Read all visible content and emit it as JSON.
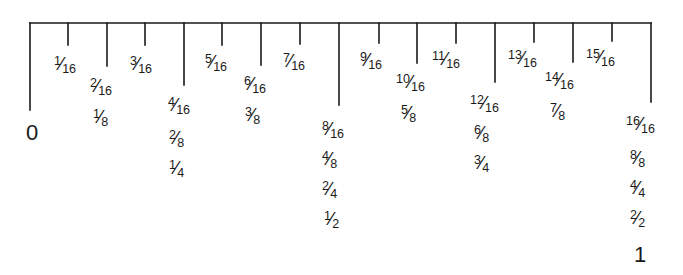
{
  "diagram": {
    "start_label": "0",
    "end_label": "1",
    "top_line": {
      "x1": 30,
      "x2": 651,
      "y": 23
    },
    "ticks": [
      {
        "index": 0,
        "x": 30,
        "y2": 110
      },
      {
        "index": 1,
        "x": 68,
        "y2": 45
      },
      {
        "index": 2,
        "x": 107,
        "y2": 66
      },
      {
        "index": 3,
        "x": 145,
        "y2": 45
      },
      {
        "index": 4,
        "x": 184,
        "y2": 85
      },
      {
        "index": 5,
        "x": 222,
        "y2": 45
      },
      {
        "index": 6,
        "x": 261,
        "y2": 65
      },
      {
        "index": 7,
        "x": 300,
        "y2": 44
      },
      {
        "index": 8,
        "x": 339,
        "y2": 105
      },
      {
        "index": 9,
        "x": 379,
        "y2": 43
      },
      {
        "index": 10,
        "x": 417,
        "y2": 63
      },
      {
        "index": 11,
        "x": 456,
        "y2": 43
      },
      {
        "index": 12,
        "x": 495,
        "y2": 82
      },
      {
        "index": 13,
        "x": 534,
        "y2": 42
      },
      {
        "index": 14,
        "x": 573,
        "y2": 62
      },
      {
        "index": 15,
        "x": 612,
        "y2": 41
      },
      {
        "index": 16,
        "x": 651,
        "y2": 102
      }
    ],
    "labels": [
      {
        "text": "1/16",
        "num": "1",
        "den": "16",
        "x": 54,
        "y": 71
      },
      {
        "text": "3/16",
        "num": "3",
        "den": "16",
        "x": 130,
        "y": 71
      },
      {
        "text": "2/16",
        "num": "2",
        "den": "16",
        "x": 90,
        "y": 93
      },
      {
        "text": "1/8",
        "num": "1",
        "den": "8",
        "x": 93,
        "y": 124
      },
      {
        "text": "5/16",
        "num": "5",
        "den": "16",
        "x": 205,
        "y": 69
      },
      {
        "text": "7/16",
        "num": "7",
        "den": "16",
        "x": 283,
        "y": 68
      },
      {
        "text": "6/16",
        "num": "6",
        "den": "16",
        "x": 244,
        "y": 91
      },
      {
        "text": "3/8",
        "num": "3",
        "den": "8",
        "x": 245,
        "y": 122
      },
      {
        "text": "4/16",
        "num": "4",
        "den": "16",
        "x": 168,
        "y": 112
      },
      {
        "text": "2/8",
        "num": "2",
        "den": "8",
        "x": 169,
        "y": 145
      },
      {
        "text": "1/4",
        "num": "1",
        "den": "4",
        "x": 169,
        "y": 175
      },
      {
        "text": "8/16",
        "num": "8",
        "den": "16",
        "x": 322,
        "y": 136
      },
      {
        "text": "4/8",
        "num": "4",
        "den": "8",
        "x": 322,
        "y": 166
      },
      {
        "text": "2/4",
        "num": "2",
        "den": "4",
        "x": 322,
        "y": 196
      },
      {
        "text": "1/2",
        "num": "1",
        "den": "2",
        "x": 324,
        "y": 226
      },
      {
        "text": "9/16",
        "num": "9",
        "den": "16",
        "x": 360,
        "y": 67
      },
      {
        "text": "11/16",
        "num": "11",
        "den": "16",
        "x": 432,
        "y": 66
      },
      {
        "text": "10/16",
        "num": "10",
        "den": "16",
        "x": 396,
        "y": 89
      },
      {
        "text": "5/8",
        "num": "5",
        "den": "8",
        "x": 401,
        "y": 120
      },
      {
        "text": "12/16",
        "num": "12",
        "den": "16",
        "x": 470,
        "y": 110
      },
      {
        "text": "6/8",
        "num": "6",
        "den": "8",
        "x": 474,
        "y": 140
      },
      {
        "text": "3/4",
        "num": "3",
        "den": "4",
        "x": 474,
        "y": 170
      },
      {
        "text": "13/16",
        "num": "13",
        "den": "16",
        "x": 508,
        "y": 65
      },
      {
        "text": "15/16",
        "num": "15",
        "den": "16",
        "x": 586,
        "y": 64
      },
      {
        "text": "14/16",
        "num": "14",
        "den": "16",
        "x": 545,
        "y": 87
      },
      {
        "text": "7/8",
        "num": "7",
        "den": "8",
        "x": 550,
        "y": 118
      },
      {
        "text": "16/16",
        "num": "16",
        "den": "16",
        "x": 626,
        "y": 131
      },
      {
        "text": "8/8",
        "num": "8",
        "den": "8",
        "x": 630,
        "y": 165
      },
      {
        "text": "4/4",
        "num": "4",
        "den": "4",
        "x": 630,
        "y": 195
      },
      {
        "text": "2/2",
        "num": "2",
        "den": "2",
        "x": 630,
        "y": 225
      }
    ],
    "start_label_pos": {
      "x": 26,
      "y": 140
    },
    "end_label_pos": {
      "x": 634,
      "y": 262
    }
  }
}
